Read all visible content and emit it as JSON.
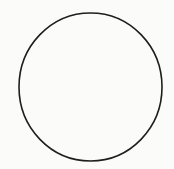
{
  "diagram": {
    "shape": "circle",
    "center": [
      90.5,
      87
    ],
    "rx": 71.5,
    "ry": 74,
    "stroke_color": "#1e1e1e",
    "stroke_width": 1.6,
    "fill": "none",
    "background_color": "#fbfbfa"
  }
}
